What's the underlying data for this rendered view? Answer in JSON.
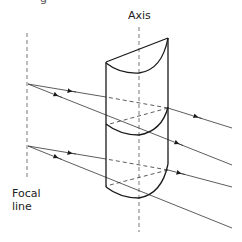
{
  "diagram": {
    "title_fragment": "g",
    "labels": {
      "axis": "Axis",
      "focal_line": "Focal line",
      "focal_line_1": "Focal",
      "focal_line_2": "line"
    },
    "colors": {
      "stroke": "#1a1a1a",
      "ray": "#333333",
      "dashed": "#555555",
      "background": "#ffffff"
    },
    "elements": {
      "cylinder": {
        "left_x": 106,
        "right_x": 168,
        "top_left_y": 62,
        "top_right_y": 38,
        "bottom_left_y": 187,
        "bottom_right_y": 164
      },
      "axis_line": {
        "x": 139,
        "y1": 27,
        "y2": 232
      },
      "focal_line": {
        "x": 27,
        "y1": 33,
        "y2": 178
      },
      "focal_points": [
        {
          "x": 28,
          "y": 84
        },
        {
          "x": 28,
          "y": 146
        }
      ],
      "ray_count": 4
    }
  }
}
